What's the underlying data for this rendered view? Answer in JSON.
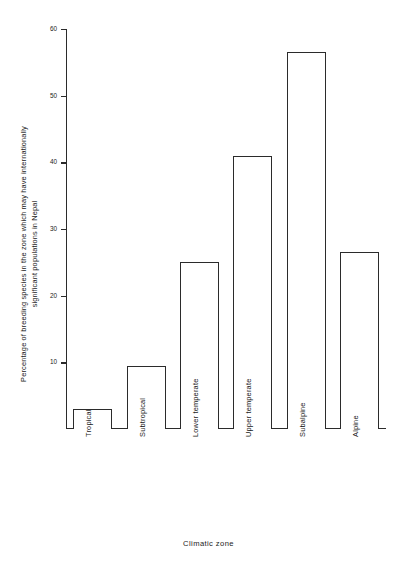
{
  "chart_data": {
    "type": "bar",
    "title": "",
    "xlabel": "Climatic  zone",
    "ylabel_line1": "Percentage of breeding species in the zone which may have internationally",
    "ylabel_line2": "significant populations in Nepal",
    "categories": [
      "Tropical",
      "Subtropical",
      "Lower temperate",
      "Upper temperate",
      "Subalpine",
      "Alpine"
    ],
    "values": [
      3,
      9.5,
      25,
      41,
      56.5,
      26.5
    ],
    "ylim": [
      0,
      60
    ],
    "yticks": [
      10,
      20,
      30,
      40,
      50,
      60
    ],
    "ytick_labels": [
      "10",
      "20",
      "30",
      "40",
      "50",
      "60"
    ],
    "grid": false,
    "legend": "none",
    "bar_fill_color": "#ffffff",
    "bar_edge_color": "#2b2b2b",
    "axis_color": "#2b2b2b",
    "background_color": "#ffffff"
  }
}
